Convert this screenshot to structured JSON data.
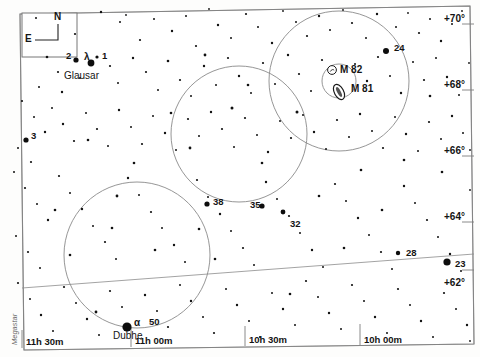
{
  "chart_data": {
    "type": "scatter",
    "credit": "Megastar",
    "xlabel": "Right Ascension",
    "ylabel": "Declination",
    "grid": false,
    "legend": false,
    "ra_ticks": [
      {
        "label": "11h 30m",
        "x": 22
      },
      {
        "label": "11h 00m",
        "x": 131
      },
      {
        "label": "10h 30m",
        "x": 245
      },
      {
        "label": "10h 00m",
        "x": 360
      }
    ],
    "dec_ticks": [
      {
        "label": "+70°",
        "y": 13
      },
      {
        "label": "+68°",
        "y": 79
      },
      {
        "label": "+66°",
        "y": 145
      },
      {
        "label": "+64°",
        "y": 211
      },
      {
        "label": "+62°",
        "y": 277
      }
    ],
    "labeled_stars": [
      {
        "name": "2",
        "lx": 66,
        "ly": 50,
        "sx": 76,
        "sy": 60,
        "r": 2.6
      },
      {
        "name": "λ",
        "lx": 84,
        "ly": 51,
        "sx": 91,
        "sy": 63,
        "r": 3.4
      },
      {
        "name": "1",
        "lx": 102,
        "ly": 50,
        "sx": 97,
        "sy": 57,
        "r": 1.6
      },
      {
        "name": "3",
        "lx": 31,
        "ly": 130,
        "sx": 26,
        "sy": 140,
        "r": 2.6
      },
      {
        "name": "24",
        "lx": 394,
        "ly": 42,
        "sx": 386,
        "sy": 51,
        "r": 3.0
      },
      {
        "name": "38",
        "lx": 213,
        "ly": 196,
        "sx": 207,
        "sy": 204,
        "r": 2.6
      },
      {
        "name": "35",
        "lx": 250,
        "ly": 199,
        "sx": 262,
        "sy": 206,
        "r": 2.6
      },
      {
        "name": "32",
        "lx": 290,
        "ly": 218,
        "sx": 283,
        "sy": 212,
        "r": 2.4
      },
      {
        "name": "28",
        "lx": 406,
        "ly": 247,
        "sx": 398,
        "sy": 253,
        "r": 2.2
      },
      {
        "name": "23",
        "lx": 455,
        "ly": 258,
        "sx": 447,
        "sy": 262,
        "r": 3.6
      },
      {
        "name": "50",
        "lx": 149,
        "ly": 316,
        "sx": 127,
        "sy": 327,
        "r": 4.6
      },
      {
        "name": "α",
        "lx": 134,
        "ly": 317,
        "sx": 127,
        "sy": 327,
        "r": 4.6
      }
    ],
    "named_stars": [
      {
        "name": "Glausar",
        "lx": 64,
        "ly": 70
      },
      {
        "name": "Dubhe",
        "lx": 113,
        "ly": 330
      }
    ],
    "deep_sky_objects": [
      {
        "name": "M 82",
        "lx": 340,
        "ly": 64,
        "sx": 332,
        "sy": 70,
        "type": "galaxy-edge-on"
      },
      {
        "name": "M 81",
        "lx": 351,
        "ly": 83,
        "sx": 339,
        "sy": 92,
        "type": "galaxy-spiral"
      }
    ],
    "finder_circles": [
      {
        "cx": 339,
        "cy": 81,
        "r": 70,
        "name": "finder-circle-m81"
      },
      {
        "cx": 239,
        "cy": 134,
        "r": 68,
        "name": "finder-circle-center"
      },
      {
        "cx": 137,
        "cy": 255,
        "r": 73,
        "name": "finder-circle-dubhe"
      },
      {
        "cx": 339,
        "cy": 81,
        "r": 17,
        "name": "eyepiece-circle-m81"
      }
    ],
    "compass": {
      "north": "N",
      "east": "E"
    },
    "field_stars": [
      [
        36,
        18,
        1.0
      ],
      [
        75,
        34,
        1.1
      ],
      [
        101,
        12,
        1.2
      ],
      [
        120,
        22,
        1.0
      ],
      [
        126,
        15,
        0.9
      ],
      [
        140,
        40,
        1.1
      ],
      [
        154,
        19,
        1.0
      ],
      [
        172,
        31,
        1.2
      ],
      [
        186,
        16,
        1.0
      ],
      [
        196,
        46,
        1.1
      ],
      [
        209,
        9,
        0.9
      ],
      [
        218,
        25,
        1.2
      ],
      [
        231,
        38,
        1.0
      ],
      [
        246,
        14,
        1.1
      ],
      [
        258,
        27,
        1.0
      ],
      [
        272,
        43,
        1.2
      ],
      [
        283,
        11,
        0.9
      ],
      [
        296,
        22,
        1.0
      ],
      [
        307,
        36,
        1.1
      ],
      [
        319,
        16,
        1.2
      ],
      [
        330,
        30,
        1.0
      ],
      [
        343,
        10,
        0.9
      ],
      [
        352,
        23,
        1.1
      ],
      [
        366,
        38,
        1.0
      ],
      [
        377,
        14,
        1.2
      ],
      [
        396,
        27,
        1.0
      ],
      [
        408,
        13,
        0.9
      ],
      [
        419,
        33,
        1.1
      ],
      [
        430,
        19,
        1.0
      ],
      [
        441,
        41,
        1.2
      ],
      [
        452,
        24,
        1.0
      ],
      [
        462,
        11,
        0.9
      ],
      [
        47,
        57,
        1.3
      ],
      [
        58,
        72,
        1.1
      ],
      [
        39,
        87,
        1.0
      ],
      [
        62,
        92,
        1.2
      ],
      [
        80,
        78,
        1.0
      ],
      [
        110,
        66,
        1.1
      ],
      [
        118,
        83,
        1.0
      ],
      [
        133,
        58,
        1.2
      ],
      [
        146,
        72,
        1.1
      ],
      [
        158,
        90,
        1.0
      ],
      [
        168,
        61,
        1.3
      ],
      [
        180,
        80,
        1.1
      ],
      [
        191,
        96,
        1.0
      ],
      [
        204,
        66,
        1.2
      ],
      [
        216,
        85,
        1.0
      ],
      [
        228,
        58,
        1.1
      ],
      [
        239,
        76,
        1.2
      ],
      [
        251,
        93,
        1.0
      ],
      [
        263,
        63,
        1.1
      ],
      [
        275,
        84,
        1.0
      ],
      [
        288,
        55,
        1.2
      ],
      [
        299,
        74,
        1.1
      ],
      [
        311,
        91,
        1.0
      ],
      [
        322,
        60,
        1.1
      ],
      [
        355,
        64,
        1.0
      ],
      [
        367,
        81,
        1.2
      ],
      [
        378,
        57,
        1.1
      ],
      [
        390,
        76,
        1.0
      ],
      [
        401,
        93,
        1.2
      ],
      [
        413,
        62,
        1.0
      ],
      [
        424,
        80,
        1.1
      ],
      [
        436,
        58,
        1.0
      ],
      [
        447,
        77,
        1.2
      ],
      [
        459,
        95,
        1.0
      ],
      [
        469,
        63,
        0.9
      ],
      [
        22,
        101,
        1.1
      ],
      [
        34,
        117,
        1.0
      ],
      [
        45,
        132,
        1.2
      ],
      [
        18,
        148,
        1.0
      ],
      [
        31,
        162,
        1.1
      ],
      [
        52,
        108,
        1.0
      ],
      [
        63,
        124,
        1.2
      ],
      [
        74,
        141,
        1.1
      ],
      [
        86,
        113,
        1.0
      ],
      [
        97,
        129,
        1.1
      ],
      [
        108,
        146,
        1.0
      ],
      [
        119,
        110,
        1.2
      ],
      [
        131,
        127,
        1.0
      ],
      [
        142,
        144,
        1.1
      ],
      [
        153,
        116,
        1.0
      ],
      [
        165,
        133,
        1.2
      ],
      [
        176,
        150,
        1.0
      ],
      [
        188,
        119,
        1.1
      ],
      [
        199,
        136,
        1.0
      ],
      [
        211,
        112,
        1.2
      ],
      [
        222,
        129,
        1.1
      ],
      [
        234,
        147,
        1.0
      ],
      [
        245,
        118,
        1.1
      ],
      [
        257,
        135,
        1.0
      ],
      [
        268,
        152,
        1.2
      ],
      [
        280,
        121,
        1.0
      ],
      [
        291,
        138,
        1.1
      ],
      [
        303,
        115,
        1.0
      ],
      [
        314,
        132,
        1.2
      ],
      [
        326,
        149,
        1.0
      ],
      [
        337,
        120,
        1.1
      ],
      [
        349,
        137,
        1.0
      ],
      [
        360,
        114,
        1.2
      ],
      [
        372,
        131,
        1.0
      ],
      [
        383,
        148,
        1.1
      ],
      [
        395,
        117,
        1.0
      ],
      [
        406,
        134,
        1.2
      ],
      [
        418,
        151,
        1.0
      ],
      [
        429,
        122,
        1.1
      ],
      [
        441,
        139,
        1.0
      ],
      [
        452,
        116,
        1.2
      ],
      [
        463,
        133,
        1.0
      ],
      [
        470,
        150,
        0.9
      ],
      [
        14,
        172,
        1.0
      ],
      [
        25,
        188,
        1.1
      ],
      [
        37,
        204,
        1.0
      ],
      [
        48,
        220,
        1.2
      ],
      [
        16,
        236,
        1.0
      ],
      [
        28,
        252,
        1.1
      ],
      [
        40,
        268,
        1.0
      ],
      [
        59,
        176,
        1.1
      ],
      [
        70,
        193,
        1.0
      ],
      [
        82,
        209,
        1.2
      ],
      [
        93,
        226,
        1.0
      ],
      [
        105,
        242,
        1.1
      ],
      [
        116,
        259,
        1.0
      ],
      [
        128,
        178,
        1.2
      ],
      [
        139,
        195,
        1.0
      ],
      [
        151,
        212,
        1.1
      ],
      [
        162,
        228,
        1.0
      ],
      [
        174,
        245,
        1.2
      ],
      [
        185,
        262,
        1.0
      ],
      [
        197,
        180,
        1.1
      ],
      [
        208,
        197,
        1.0
      ],
      [
        220,
        214,
        1.2
      ],
      [
        231,
        231,
        1.0
      ],
      [
        243,
        248,
        1.1
      ],
      [
        254,
        265,
        1.0
      ],
      [
        266,
        182,
        1.2
      ],
      [
        277,
        199,
        1.0
      ],
      [
        289,
        216,
        1.1
      ],
      [
        300,
        233,
        1.0
      ],
      [
        312,
        250,
        1.2
      ],
      [
        323,
        267,
        1.0
      ],
      [
        335,
        184,
        1.1
      ],
      [
        346,
        201,
        1.0
      ],
      [
        358,
        218,
        1.2
      ],
      [
        369,
        235,
        1.0
      ],
      [
        381,
        252,
        1.1
      ],
      [
        392,
        269,
        1.0
      ],
      [
        404,
        186,
        1.2
      ],
      [
        415,
        203,
        1.0
      ],
      [
        427,
        220,
        1.1
      ],
      [
        438,
        237,
        1.0
      ],
      [
        450,
        254,
        1.2
      ],
      [
        461,
        271,
        1.0
      ],
      [
        470,
        190,
        0.9
      ],
      [
        18,
        283,
        1.1
      ],
      [
        30,
        299,
        1.0
      ],
      [
        41,
        315,
        1.2
      ],
      [
        53,
        331,
        1.0
      ],
      [
        64,
        287,
        1.1
      ],
      [
        76,
        303,
        1.0
      ],
      [
        87,
        319,
        1.2
      ],
      [
        99,
        335,
        1.0
      ],
      [
        110,
        291,
        1.1
      ],
      [
        122,
        307,
        1.0
      ],
      [
        145,
        295,
        1.2
      ],
      [
        157,
        311,
        1.0
      ],
      [
        168,
        327,
        1.1
      ],
      [
        180,
        285,
        1.0
      ],
      [
        191,
        301,
        1.2
      ],
      [
        203,
        317,
        1.0
      ],
      [
        214,
        333,
        1.1
      ],
      [
        226,
        289,
        1.0
      ],
      [
        237,
        305,
        1.2
      ],
      [
        249,
        321,
        1.0
      ],
      [
        260,
        337,
        1.1
      ],
      [
        272,
        293,
        1.0
      ],
      [
        283,
        309,
        1.2
      ],
      [
        295,
        325,
        1.0
      ],
      [
        306,
        281,
        1.1
      ],
      [
        318,
        297,
        1.0
      ],
      [
        329,
        313,
        1.2
      ],
      [
        341,
        329,
        1.0
      ],
      [
        352,
        285,
        1.1
      ],
      [
        364,
        301,
        1.0
      ],
      [
        375,
        317,
        1.2
      ],
      [
        387,
        333,
        1.0
      ],
      [
        398,
        289,
        1.1
      ],
      [
        410,
        305,
        1.0
      ],
      [
        421,
        321,
        1.2
      ],
      [
        433,
        337,
        1.0
      ],
      [
        444,
        293,
        1.1
      ],
      [
        456,
        309,
        1.0
      ],
      [
        467,
        325,
        1.2
      ],
      [
        470,
        341,
        0.9
      ],
      [
        205,
        55,
        1.4
      ],
      [
        232,
        108,
        1.5
      ],
      [
        297,
        112,
        1.5
      ],
      [
        190,
        148,
        1.4
      ],
      [
        117,
        196,
        1.4
      ],
      [
        262,
        163,
        1.3
      ],
      [
        155,
        250,
        1.3
      ],
      [
        215,
        259,
        1.3
      ],
      [
        96,
        312,
        1.4
      ],
      [
        55,
        210,
        1.3
      ],
      [
        361,
        170,
        1.3
      ],
      [
        404,
        160,
        1.3
      ],
      [
        442,
        172,
        1.3
      ],
      [
        134,
        163,
        1.3
      ],
      [
        88,
        140,
        1.3
      ],
      [
        248,
        85,
        1.3
      ],
      [
        319,
        196,
        1.3
      ],
      [
        382,
        210,
        1.3
      ],
      [
        171,
        113,
        1.3
      ],
      [
        70,
        255,
        1.3
      ],
      [
        430,
        96,
        1.3
      ],
      [
        290,
        294,
        1.3
      ],
      [
        199,
        229,
        1.3
      ],
      [
        344,
        248,
        1.3
      ],
      [
        112,
        228,
        1.3
      ]
    ]
  }
}
